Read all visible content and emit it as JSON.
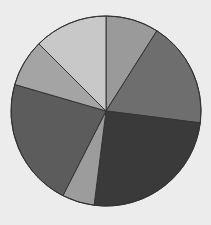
{
  "chart_data": {
    "type": "pie",
    "title": "",
    "categories": [
      "Slice 1",
      "Slice 2",
      "Slice 3",
      "Slice 4",
      "Slice 5",
      "Slice 6",
      "Slice 7"
    ],
    "values": [
      9,
      18,
      25,
      5.5,
      22,
      8,
      12.5
    ],
    "colors": [
      "#9a9a9a",
      "#6e6e6e",
      "#3a3a3a",
      "#9c9c9c",
      "#5c5c5c",
      "#a4a4a4",
      "#c8c8c8"
    ],
    "start_angle_deg": 0,
    "direction": "clockwise",
    "legend": "none",
    "labels_visible": false
  },
  "layout": {
    "center_x": 106,
    "center_y": 111,
    "radius": 95,
    "stroke_color": "#333333",
    "background": "#ececec"
  }
}
